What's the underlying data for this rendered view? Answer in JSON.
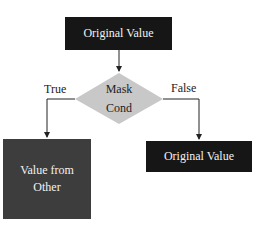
{
  "diagram": {
    "nodes": {
      "original_top": {
        "label": "Original Value",
        "shape": "rectangle",
        "fill": "#161616"
      },
      "condition": {
        "label_line1": "Mask",
        "label_line2": "Cond",
        "shape": "diamond",
        "fill": "#c8c8c8"
      },
      "true_result": {
        "label_line1": "Value from",
        "label_line2": "Other",
        "shape": "rectangle",
        "fill": "#3d3d3d"
      },
      "false_result": {
        "label": "Original Value",
        "shape": "rectangle",
        "fill": "#161616"
      }
    },
    "edges": {
      "true_label": "True",
      "false_label": "False"
    }
  }
}
